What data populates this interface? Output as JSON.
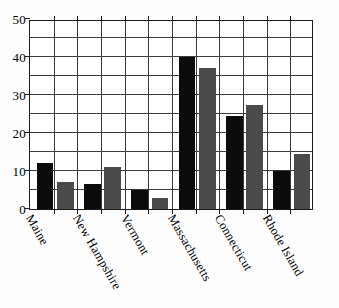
{
  "chart_data": {
    "type": "bar",
    "title": "",
    "subtitle": "",
    "xlabel": "",
    "ylabel": "",
    "categories": [
      "Maine",
      "New Hampshire",
      "Vermont",
      "Massachusetts",
      "Connecticut",
      "Rhode Island"
    ],
    "series": [
      {
        "name": "Series 1",
        "color": "#0b0b0b",
        "values": [
          12,
          6.5,
          5,
          40,
          24.5,
          10
        ]
      },
      {
        "name": "Series 2",
        "color": "#4a4a4a",
        "values": [
          7,
          11,
          3,
          37,
          27.5,
          14.5
        ]
      }
    ],
    "ylim": [
      0,
      50
    ],
    "ytick_labels": [
      "0",
      "10",
      "20",
      "30",
      "40",
      "50"
    ],
    "ytick_values": [
      0,
      10,
      20,
      30,
      40,
      50
    ],
    "minor_gridline_values": [
      5,
      15,
      25,
      35,
      45
    ],
    "grid": true,
    "legend": "none",
    "axis_color": "#1c1c1c",
    "grid_color": "#3a3a3a",
    "background_color": "#ffffff"
  }
}
